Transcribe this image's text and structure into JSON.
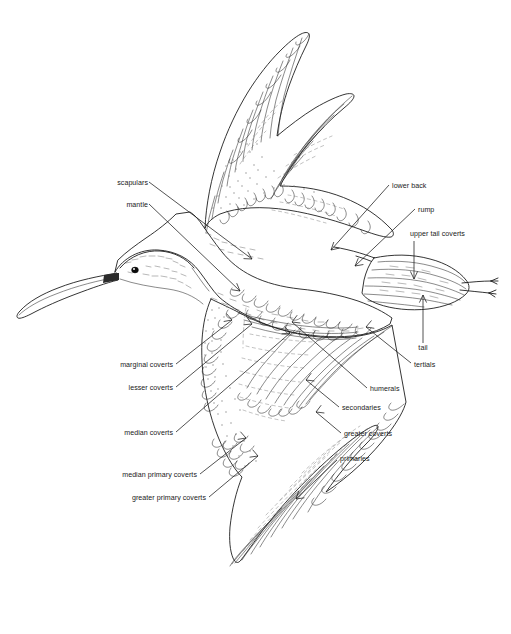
{
  "figure": {
    "background_color": "#ffffff",
    "line_color": "#111111",
    "label_color": "#1a1a1a"
  },
  "labels": {
    "scapulars": "scapulars",
    "mantle": "mantle",
    "lower_back": "lower back",
    "rump": "rump",
    "upper_tail_coverts": "upper tail coverts",
    "tail": "tail",
    "tertials": "tertials",
    "humerals": "humerals",
    "secondaries": "secondaries",
    "greater_coverts": "greater coverts",
    "primaries": "primaries",
    "marginal_coverts": "marginal coverts",
    "lesser_coverts": "lesser coverts",
    "median_coverts": "median coverts",
    "median_primary_coverts": "median primary coverts",
    "greater_primary_coverts": "greater primary coverts"
  },
  "annotations": [
    {
      "key": "scapulars",
      "side": "left",
      "text_x": 140,
      "text_y": 185
    },
    {
      "key": "mantle",
      "side": "left",
      "text_x": 140,
      "text_y": 207
    },
    {
      "key": "marginal_coverts",
      "side": "left",
      "text_x": 172,
      "text_y": 367
    },
    {
      "key": "lesser_coverts",
      "side": "left",
      "text_x": 172,
      "text_y": 390
    },
    {
      "key": "median_coverts",
      "side": "left",
      "text_x": 172,
      "text_y": 435
    },
    {
      "key": "median_primary_coverts",
      "side": "left",
      "text_x": 196,
      "text_y": 477
    },
    {
      "key": "greater_primary_coverts",
      "side": "left",
      "text_x": 205,
      "text_y": 500
    },
    {
      "key": "lower_back",
      "side": "right",
      "text_x": 392,
      "text_y": 187
    },
    {
      "key": "rump",
      "side": "right",
      "text_x": 418,
      "text_y": 211
    },
    {
      "key": "upper_tail_coverts",
      "side": "right",
      "text_x": 410,
      "text_y": 236
    },
    {
      "key": "tail",
      "side": "right",
      "text_x": 436,
      "text_y": 349
    },
    {
      "key": "tertials",
      "side": "right",
      "text_x": 414,
      "text_y": 367
    },
    {
      "key": "humerals",
      "side": "right",
      "text_x": 370,
      "text_y": 391
    },
    {
      "key": "secondaries",
      "side": "right",
      "text_x": 342,
      "text_y": 410
    },
    {
      "key": "greater_coverts",
      "side": "right",
      "text_x": 344,
      "text_y": 436
    },
    {
      "key": "primaries",
      "side": "right",
      "text_x": 340,
      "text_y": 461
    }
  ]
}
